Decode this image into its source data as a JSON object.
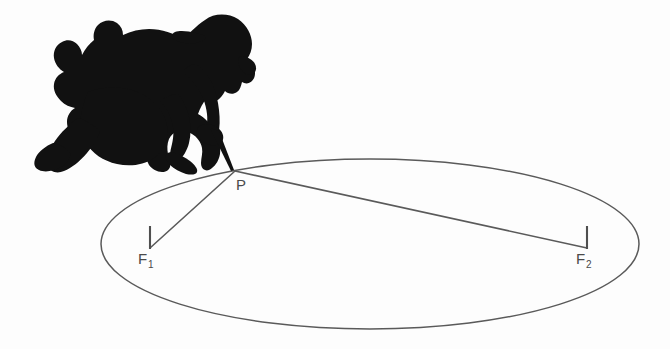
{
  "figure": {
    "domain": "diagram",
    "background_color": "#fdfdfd",
    "stroke_color": "#5a5a5a",
    "silhouette_color": "#111111",
    "label_color": "#4a4a4a"
  },
  "labels": {
    "point_p": "P",
    "focus_1_base": "F",
    "focus_1_sub": "1",
    "focus_2_base": "F",
    "focus_2_sub": "2"
  },
  "geometry": {
    "ellipse": {
      "center_x": 370,
      "center_y": 244,
      "radius_x": 269,
      "radius_y": 85
    },
    "point_p": {
      "x": 235,
      "y": 171
    },
    "focus_1": {
      "x": 150,
      "y": 248
    },
    "focus_2": {
      "x": 587,
      "y": 248
    },
    "peg_1": {
      "x": 150,
      "y_top": 226,
      "y_bottom": 248
    },
    "peg_2": {
      "x": 587,
      "y_top": 226,
      "y_bottom": 248
    },
    "string_segments": [
      {
        "name": "p-to-f1",
        "x1": 235,
        "y1": 171,
        "x2": 150,
        "y2": 248
      },
      {
        "name": "p-to-f2",
        "x1": 235,
        "y1": 171,
        "x2": 587,
        "y2": 248
      }
    ]
  },
  "silhouette": {
    "name": "kneeling-person-drawing",
    "bounds": {
      "x": 33,
      "y": 13,
      "width": 225,
      "height": 160
    },
    "parts": [
      "cap",
      "head",
      "back",
      "arm",
      "hand",
      "pencil",
      "knee",
      "leg",
      "foot"
    ]
  }
}
